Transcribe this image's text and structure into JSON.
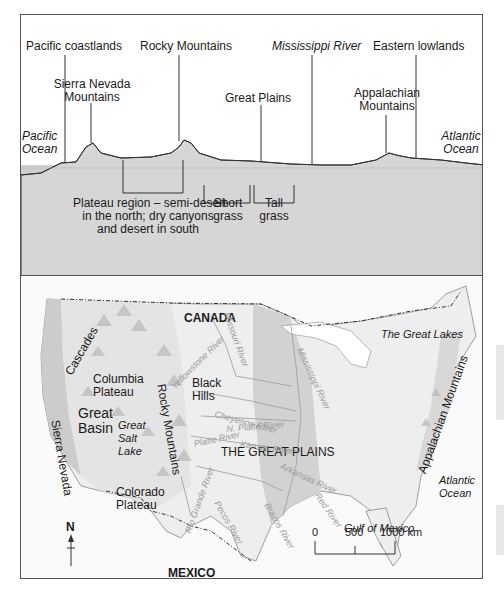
{
  "profile": {
    "top_labels": {
      "pacific_coastlands": "Pacific coastlands",
      "rocky_mountains": "Rocky Mountains",
      "mississippi_river": "Mississippi River",
      "eastern_lowlands": "Eastern lowlands",
      "sierra_nevada_line1": "Sierra Nevada",
      "sierra_nevada_line2": "Mountains",
      "great_plains": "Great Plains",
      "appalachian_line1": "Appalachian",
      "appalachian_line2": "Mountains"
    },
    "oceans": {
      "pacific_line1": "Pacific",
      "pacific_line2": "Ocean",
      "atlantic_line1": "Atlantic",
      "atlantic_line2": "Ocean"
    },
    "vegetation": {
      "plateau_line1": "Plateau region – semi-desert",
      "plateau_line2": "in the north; dry canyons",
      "plateau_line3": "and desert in south",
      "short_line1": "Short",
      "short_line2": "grass",
      "tall_line1": "Tall",
      "tall_line2": "grass"
    }
  },
  "map": {
    "countries": {
      "canada": "CANADA",
      "mexico": "MEXICO"
    },
    "regions": {
      "great_lakes": "The Great Lakes",
      "cascades": "Cascades",
      "columbia_line1": "Columbia",
      "columbia_line2": "Plateau",
      "black_hills_line1": "Black",
      "black_hills_line2": "Hills",
      "great_basin_line1": "Great",
      "great_basin_line2": "Basin",
      "salt_lake_line1": "Great",
      "salt_lake_line2": "Salt",
      "salt_lake_line3": "Lake",
      "rocky_mountains": "Rocky Mountains",
      "sierra_nevada": "Sierra Nevada",
      "colorado_line1": "Colorado",
      "colorado_line2": "Plateau",
      "great_plains": "THE GREAT PLAINS",
      "appalachian": "Appalachian Mountains",
      "atlantic_line1": "Atlantic",
      "atlantic_line2": "Ocean",
      "gulf": "Gulf of Mexico"
    },
    "rivers": {
      "missouri": "Missouri River",
      "yellowstone": "Yellowstone River",
      "cheyenne": "Cheyenne River",
      "n_platte": "N. Platte River",
      "platte": "Platte River",
      "kansas": "Kansas River",
      "mississippi": "Mississippi River",
      "arkansas": "Arkansas River",
      "red": "Red River",
      "brazos": "Brazos River",
      "pecos": "Pecos River",
      "rio_grande": "Rio Grande River"
    },
    "compass": {
      "north": "N"
    },
    "scale": {
      "t0": "0",
      "t1": "500",
      "t2": "1000 km"
    }
  },
  "colors": {
    "band_dark": "#c8c8c8",
    "band_mid": "#dedede",
    "band_light": "#eeeeee",
    "land": "#f4f4f4",
    "border": "#555555"
  }
}
